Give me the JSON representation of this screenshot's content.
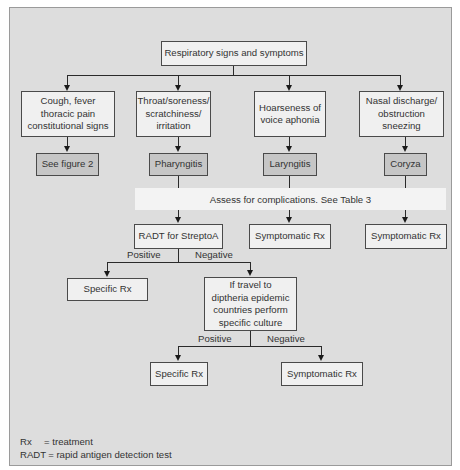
{
  "root": {
    "label": "Respiratory signs and symptoms"
  },
  "symptoms": [
    {
      "label": "Cough, fever\nthoracic pain\nconstitutional signs"
    },
    {
      "label": "Throat/soreness/\nscratchiness/\nirritation"
    },
    {
      "label": "Hoarseness of\nvoice aphonia"
    },
    {
      "label": "Nasal discharge/\nobstruction\nsneezing"
    }
  ],
  "diagnoses": [
    {
      "label": "See figure 2"
    },
    {
      "label": "Pharyngitis"
    },
    {
      "label": "Laryngitis"
    },
    {
      "label": "Coryza"
    }
  ],
  "assess_band": {
    "label": "Assess for complications. See Table 3"
  },
  "third_row": [
    {
      "label": "RADT for StreptoA"
    },
    {
      "label": "Symptomatic Rx"
    },
    {
      "label": "Symptomatic Rx"
    }
  ],
  "radt_branch": {
    "positive_label": "Positive",
    "negative_label": "Negative",
    "positive_box": "Specific Rx",
    "negative_box": "If travel to\ndiptheria epidemic\ncountries perform\nspecific culture"
  },
  "culture_branch": {
    "positive_label": "Positive",
    "negative_label": "Negative",
    "positive_box": "Specific Rx",
    "negative_box": "Symptomatic Rx"
  },
  "legend": [
    {
      "key": "Rx",
      "value": "= treatment"
    },
    {
      "key": "RADT",
      "value": "= rapid antigen detection test"
    }
  ],
  "colors": {
    "panel_bg": "#dddddd",
    "box_light": "#f0f0f0",
    "box_dark": "#c6c6c6",
    "band": "#f3f3f3",
    "line": "#2a2a2a"
  }
}
